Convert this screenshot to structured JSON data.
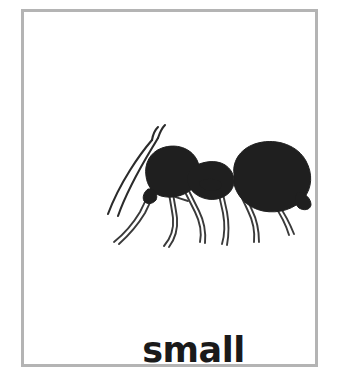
{
  "card": {
    "word": "small",
    "illustration_name": "ant-illustration",
    "illustration_alt": "black and white line drawing of an ant facing left",
    "border_color": "#b4b4b4",
    "background_color": "#ffffff",
    "ink_color": "#1a1a1a",
    "text_color": "#1a1a1a"
  }
}
